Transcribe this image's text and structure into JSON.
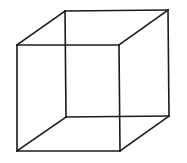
{
  "diagram": {
    "type": "necker-cube",
    "stroke_color": "#1a1a1a",
    "stroke_width": 1.6,
    "background": "#ffffff",
    "vertices": {
      "front_top_left": [
        17,
        45
      ],
      "front_top_right": [
        119,
        45
      ],
      "front_bottom_right": [
        120,
        151
      ],
      "front_bottom_left": [
        17,
        151
      ],
      "back_top_left": [
        65,
        11
      ],
      "back_top_right": [
        168,
        10
      ],
      "back_bottom_right": [
        169,
        116
      ],
      "back_bottom_left": [
        66,
        117
      ]
    },
    "edges": [
      [
        "front_top_left",
        "front_top_right"
      ],
      [
        "front_top_right",
        "front_bottom_right"
      ],
      [
        "front_bottom_right",
        "front_bottom_left"
      ],
      [
        "front_bottom_left",
        "front_top_left"
      ],
      [
        "back_top_left",
        "back_top_right"
      ],
      [
        "back_top_right",
        "back_bottom_right"
      ],
      [
        "back_bottom_right",
        "back_bottom_left"
      ],
      [
        "back_bottom_left",
        "back_top_left"
      ],
      [
        "front_top_left",
        "back_top_left"
      ],
      [
        "front_top_right",
        "back_top_right"
      ],
      [
        "front_bottom_right",
        "back_bottom_right"
      ],
      [
        "front_bottom_left",
        "back_bottom_left"
      ]
    ]
  }
}
